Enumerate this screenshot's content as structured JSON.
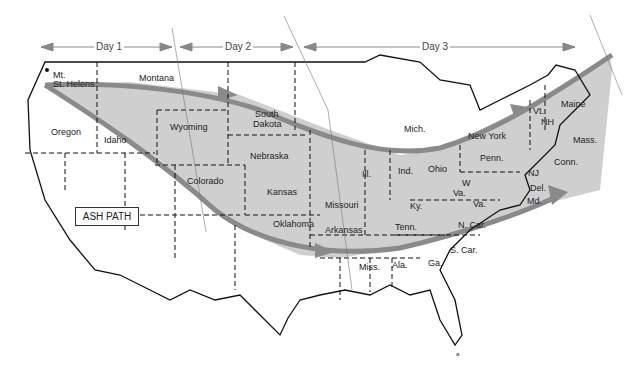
{
  "map": {
    "title": "Mt. St. Helens Ash Path",
    "legend_box": "ASH PATH",
    "day_labels": [
      "Day 1",
      "Day 2",
      "Day 3"
    ],
    "origin_label": "Mt. St. Helens",
    "origin_line1": "Mt.",
    "origin_line2": "St. Helens",
    "footnote": "a",
    "colors": {
      "ash_fill": "#cfcfcf",
      "ash_arrow": "#8a8a8a",
      "border": "#111111",
      "day_arrow": "#888888"
    },
    "states": {
      "montana": "Montana",
      "oregon": "Oregon",
      "idaho": "Idaho",
      "wyoming": "Wyoming",
      "south_dakota_1": "South",
      "south_dakota_2": "Dakota",
      "nebraska": "Nebraska",
      "colorado": "Colorado",
      "kansas": "Kansas",
      "oklahoma": "Oklahoma",
      "missouri": "Missouri",
      "arkansas": "Arkansas",
      "illinois": "Ill.",
      "indiana": "Ind.",
      "ohio": "Ohio",
      "michigan": "Mich.",
      "kentucky": "Ky.",
      "tennessee": "Tenn.",
      "west_virginia_1": "W",
      "west_virginia_2": "Va.",
      "virginia": "Va.",
      "north_carolina": "N. Car.",
      "south_carolina": "S. Car.",
      "mississippi": "Miss.",
      "alabama": "Ala.",
      "georgia": "Ga.",
      "pennsylvania": "Penn.",
      "new_york": "New York",
      "new_jersey": "NJ",
      "delaware": "Del.",
      "maryland": "Md.",
      "connecticut": "Conn.",
      "massachusetts": "Mass.",
      "vermont": "Vt.",
      "new_hampshire": "NH",
      "maine": "Maine"
    }
  }
}
